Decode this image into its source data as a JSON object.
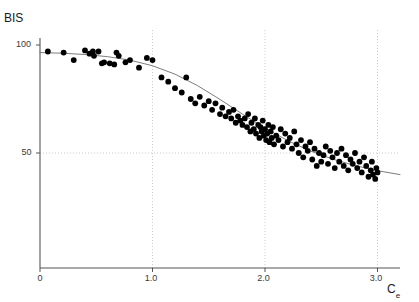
{
  "figure": {
    "width": 419,
    "height": 302,
    "background": "#ffffff"
  },
  "axes": {
    "y_title": "BIS",
    "x_title_base": "C",
    "x_title_sub": "e",
    "x_ticks": [
      "0",
      "1.0",
      "2.0",
      "3.0"
    ],
    "y_ticks": [
      "100",
      "50"
    ],
    "axis_color": "#555555",
    "grid_color": "#bdbdbd",
    "point_color": "#000000",
    "curve_color": "#6e6e6e"
  },
  "chart_data": {
    "type": "scatter",
    "title": "",
    "xlabel": "Ce",
    "ylabel": "BIS",
    "xlim": [
      0,
      3.2
    ],
    "ylim": [
      28,
      104
    ],
    "grid": true,
    "legend": "none",
    "xticks": [
      0,
      1.0,
      2.0,
      3.0
    ],
    "yticks": [
      50,
      100
    ],
    "series": [
      {
        "name": "BIS observations",
        "marker": "filled-circle",
        "color": "#000000",
        "x": [
          0.07,
          0.21,
          0.3,
          0.4,
          0.44,
          0.47,
          0.48,
          0.52,
          0.55,
          0.57,
          0.62,
          0.66,
          0.68,
          0.7,
          0.76,
          0.8,
          0.88,
          0.95,
          1.0,
          1.08,
          1.14,
          1.2,
          1.26,
          1.3,
          1.34,
          1.38,
          1.42,
          1.46,
          1.5,
          1.53,
          1.56,
          1.6,
          1.62,
          1.65,
          1.68,
          1.7,
          1.72,
          1.74,
          1.76,
          1.78,
          1.8,
          1.82,
          1.84,
          1.85,
          1.87,
          1.88,
          1.9,
          1.91,
          1.92,
          1.94,
          1.95,
          1.96,
          1.97,
          1.98,
          1.99,
          2.0,
          2.01,
          2.02,
          2.03,
          2.04,
          2.05,
          2.06,
          2.07,
          2.08,
          2.1,
          2.12,
          2.14,
          2.16,
          2.18,
          2.2,
          2.22,
          2.24,
          2.26,
          2.28,
          2.3,
          2.32,
          2.34,
          2.36,
          2.38,
          2.4,
          2.42,
          2.44,
          2.46,
          2.48,
          2.5,
          2.52,
          2.54,
          2.56,
          2.58,
          2.6,
          2.62,
          2.64,
          2.66,
          2.68,
          2.7,
          2.72,
          2.74,
          2.76,
          2.78,
          2.8,
          2.82,
          2.84,
          2.86,
          2.88,
          2.9,
          2.92,
          2.94,
          2.95,
          2.96,
          2.98,
          2.99,
          3.0
        ],
        "y": [
          97.0,
          96.5,
          93.0,
          97.5,
          96.0,
          97.0,
          95.0,
          97.0,
          91.5,
          92.0,
          91.5,
          91.0,
          96.5,
          95.0,
          92.0,
          93.0,
          89.5,
          94.0,
          93.0,
          85.0,
          83.0,
          80.0,
          78.0,
          85.0,
          75.0,
          73.0,
          76.0,
          72.0,
          74.0,
          70.0,
          73.0,
          68.0,
          71.0,
          67.0,
          69.0,
          66.0,
          70.0,
          64.0,
          67.0,
          65.0,
          63.0,
          66.0,
          62.0,
          68.0,
          60.0,
          64.0,
          61.0,
          66.0,
          59.0,
          63.0,
          57.0,
          62.0,
          60.0,
          65.0,
          58.0,
          61.0,
          56.0,
          59.0,
          63.0,
          55.0,
          60.0,
          57.0,
          62.0,
          54.0,
          58.0,
          56.0,
          61.0,
          53.0,
          59.0,
          55.0,
          57.0,
          52.0,
          60.0,
          54.0,
          50.0,
          56.0,
          48.0,
          53.0,
          51.0,
          55.0,
          47.0,
          52.0,
          44.0,
          50.0,
          46.0,
          49.0,
          53.0,
          45.0,
          51.0,
          48.0,
          43.0,
          50.0,
          46.0,
          52.0,
          44.0,
          49.0,
          42.0,
          47.0,
          45.0,
          50.0,
          43.0,
          46.0,
          41.0,
          48.0,
          44.0,
          39.0,
          42.0,
          46.0,
          40.0,
          38.0,
          43.0,
          41.0
        ]
      }
    ],
    "fit_curve": {
      "name": "sigmoid Emax fit",
      "color": "#6e6e6e",
      "x": [
        0.0,
        0.2,
        0.4,
        0.6,
        0.8,
        1.0,
        1.2,
        1.4,
        1.6,
        1.8,
        2.0,
        2.2,
        2.4,
        2.6,
        2.8,
        3.0,
        3.2
      ],
      "y": [
        96.5,
        96.2,
        95.6,
        94.6,
        93.0,
        90.4,
        86.5,
        81.2,
        74.8,
        68.0,
        61.5,
        55.8,
        51.0,
        47.2,
        44.2,
        41.8,
        40.0
      ]
    }
  }
}
